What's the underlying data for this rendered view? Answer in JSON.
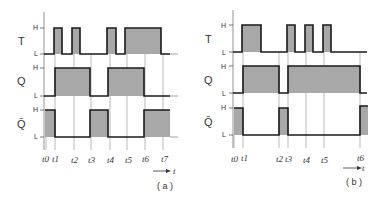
{
  "colors": {
    "wave": "#1a1a1a",
    "fill": "#a8a8a8",
    "grid": "#8a8a8a",
    "text": "#333333"
  },
  "diagram_a": {
    "caption": "( a )",
    "axis_label": "t",
    "signals": [
      {
        "name": "T",
        "high": "H",
        "low": "L"
      },
      {
        "name": "Q",
        "high": "H",
        "low": "L"
      },
      {
        "name": "Q̄",
        "high": "H",
        "low": "L"
      }
    ],
    "time_labels": [
      "t0",
      "t1",
      "t2",
      "t3",
      "t4",
      "t5",
      "t6",
      "t7"
    ]
  },
  "diagram_b": {
    "caption": "( b )",
    "axis_label": "t",
    "signals": [
      {
        "name": "T",
        "high": "H",
        "low": "L"
      },
      {
        "name": "Q",
        "high": "H",
        "low": "L"
      },
      {
        "name": "Q̄",
        "high": "H",
        "low": "L"
      }
    ],
    "time_labels": [
      "t0",
      "t1",
      "t2",
      "t3",
      "t4",
      "t5",
      "t6"
    ]
  }
}
